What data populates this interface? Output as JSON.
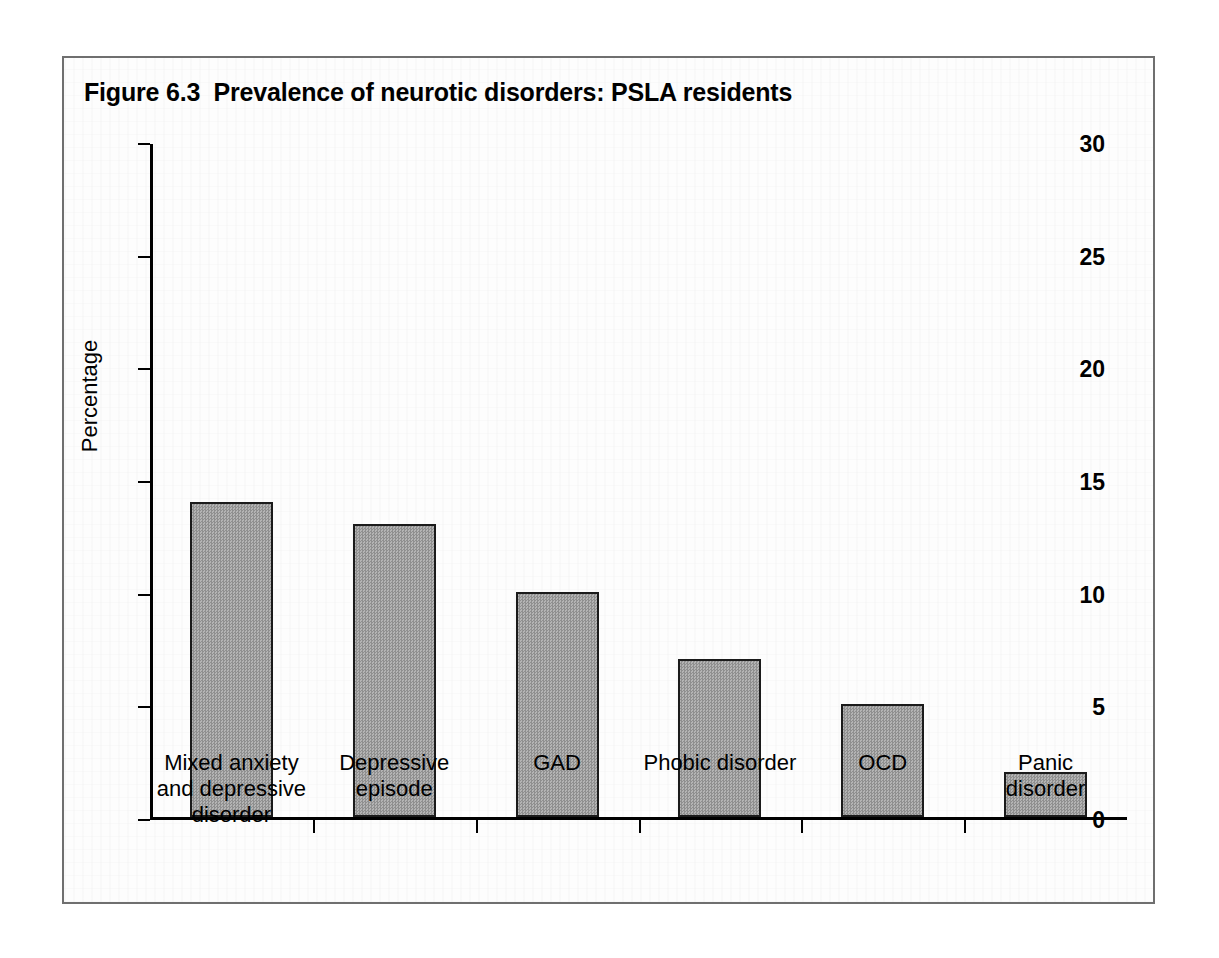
{
  "figure": {
    "title": "Figure 6.3  Prevalence of neurotic disorders: PSLA residents",
    "frame_color": "#6f6f6f",
    "bar_fill_color": "#a2a2a2",
    "bar_edge_color": "#1b1b1b"
  },
  "chart_data": {
    "type": "bar",
    "title": "Figure 6.3  Prevalence of neurotic disorders: PSLA residents",
    "categories": [
      "Mixed anxiety\nand depressive\ndisorder",
      "Depressive\nepisode",
      "GAD",
      "Phobic disorder",
      "OCD",
      "Panic disorder"
    ],
    "values": [
      14,
      13,
      10,
      7,
      5,
      2
    ],
    "xlabel": "",
    "ylabel": "Percentage",
    "ylim": [
      0,
      30
    ],
    "yticks": [
      0,
      5,
      10,
      15,
      20,
      25,
      30
    ],
    "ytick_labels": [
      "0",
      "5",
      "10",
      "15",
      "20",
      "25",
      "30"
    ],
    "grid": false,
    "legend": false
  }
}
